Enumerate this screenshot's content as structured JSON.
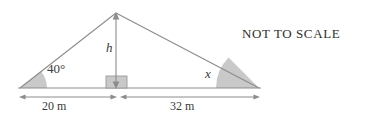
{
  "figure": {
    "kind": "geometry-diagram",
    "note": "NOT TO SCALE",
    "stroke_color": "#8c8c8c",
    "fill_color": "#c9c9c9",
    "text_color": "#3a3a3a",
    "background": "#ffffff",
    "triangle": {
      "apex_label": "",
      "left_vertex": [
        20,
        88
      ],
      "apex": [
        116,
        13
      ],
      "right_vertex": [
        259,
        88
      ],
      "foot_of_height": [
        116,
        88
      ]
    },
    "angles": [
      {
        "name": "left-base-angle",
        "label": "40°",
        "value": "40",
        "unit": "degrees",
        "at": "left-vertex"
      },
      {
        "name": "right-base-angle",
        "label": "x",
        "value": "x",
        "unit": "unknown",
        "at": "right-vertex"
      }
    ],
    "height": {
      "label": "h",
      "marker": "right-angle-square",
      "description": "perpendicular height from apex to base"
    },
    "dimensions": [
      {
        "name": "left-segment",
        "label": "20 m",
        "value": 20,
        "unit": "m",
        "from": 20,
        "to": 116
      },
      {
        "name": "right-segment",
        "label": "32 m",
        "value": 32,
        "unit": "m",
        "from": 118,
        "to": 259
      }
    ]
  }
}
